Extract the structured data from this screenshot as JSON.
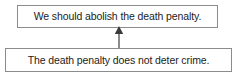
{
  "diagram": {
    "type": "argument-map",
    "title": "",
    "width": 238,
    "height": 75,
    "background_color": "#ffffff",
    "border_color": "#8c8c8c",
    "text_color": "#1c1c1c",
    "arrow_color": "#6e6e6e",
    "nodes": [
      {
        "id": "claim",
        "role": "conclusion",
        "text": "We should abolish the death penalty."
      },
      {
        "id": "premise",
        "role": "premise",
        "text": "The death penalty does not deter crime."
      }
    ],
    "edges": [
      {
        "id": "support",
        "from": "premise",
        "to": "claim",
        "relation": "supports",
        "style": "solid-arrow",
        "direction": "up"
      }
    ]
  }
}
